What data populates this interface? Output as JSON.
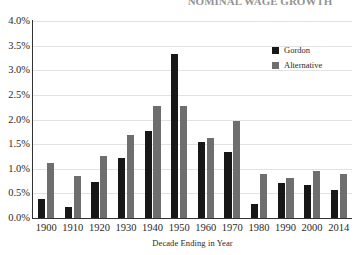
{
  "chart_data": {
    "type": "bar",
    "title": "NOMINAL WAGE GROWTH",
    "xlabel": "Decade Ending in Year",
    "ylabel": "",
    "ylim": [
      0,
      4.0
    ],
    "yticks": [
      "0.0%",
      "0.5%",
      "1.0%",
      "1.5%",
      "2.0%",
      "2.5%",
      "3.0%",
      "3.5%",
      "4.0%"
    ],
    "ytick_values": [
      0.0,
      0.5,
      1.0,
      1.5,
      2.0,
      2.5,
      3.0,
      3.5,
      4.0
    ],
    "grid": true,
    "legend_position": "upper right",
    "categories": [
      "1900",
      "1910",
      "1920",
      "1930",
      "1940",
      "1950",
      "1960",
      "1970",
      "1980",
      "1990",
      "2000",
      "2014"
    ],
    "series": [
      {
        "name": "Gordon",
        "color": "#171717",
        "values": [
          0.38,
          0.22,
          0.74,
          1.21,
          1.77,
          3.33,
          1.54,
          1.35,
          0.28,
          0.71,
          0.68,
          0.57
        ]
      },
      {
        "name": "Alternative",
        "color": "#6e6e6e",
        "values": [
          1.12,
          0.85,
          1.25,
          1.69,
          2.27,
          2.27,
          1.62,
          1.98,
          0.9,
          0.81,
          0.96,
          0.89
        ]
      }
    ]
  }
}
